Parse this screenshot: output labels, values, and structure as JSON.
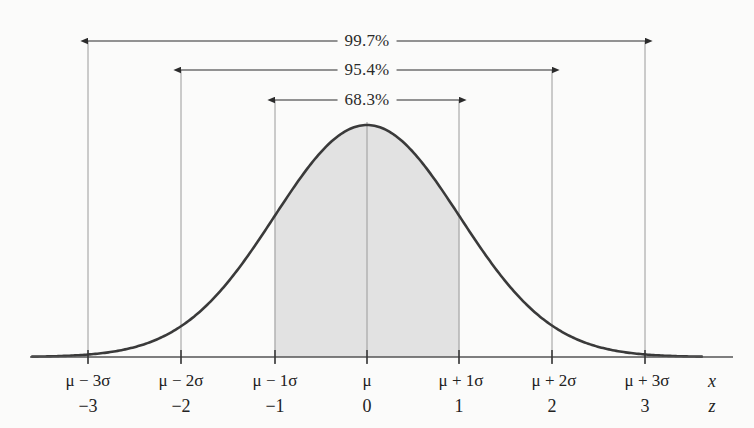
{
  "figure": {
    "type": "normal-distribution-empirical-rule",
    "background_color": "#fbfbfa",
    "curve_color": "#3a3a3a",
    "shade_color": "#e2e2e2",
    "guide_color": "#9a9a9a",
    "axis_color": "#555555"
  },
  "chart_data": {
    "type": "line",
    "title": "",
    "xlabel": "x",
    "ylabel": "",
    "grid": false,
    "legend": null,
    "distribution": "normal",
    "mean": 0,
    "sd": 1,
    "x": [
      -3.5,
      -3,
      -2,
      -1,
      0,
      1,
      2,
      3,
      3.5
    ],
    "y": [
      0.0009,
      0.0111,
      0.1353,
      0.6065,
      1.0,
      0.6065,
      0.1353,
      0.0111,
      0.0009
    ],
    "xlim": [
      -3.62,
      3.62
    ],
    "ylim": [
      0,
      1
    ],
    "shaded_region": {
      "from": -1,
      "to": 1,
      "label": "68.3%"
    },
    "annotations": [
      {
        "label": "99.7%",
        "from": -3,
        "to": 3,
        "row": 1
      },
      {
        "label": "95.4%",
        "from": -2,
        "to": 2,
        "row": 2
      },
      {
        "label": "68.3%",
        "from": -1,
        "to": 1,
        "row": 3
      }
    ],
    "tick_labels_x": [
      "μ − 3σ",
      "μ − 2σ",
      "μ − 1σ",
      "μ",
      "μ + 1σ",
      "μ + 2σ",
      "μ + 3σ"
    ],
    "tick_labels_z": [
      "−3",
      "−2",
      "−1",
      "0",
      "1",
      "2",
      "3"
    ],
    "categories": [
      "-3",
      "-2",
      "-1",
      "0",
      "1",
      "2",
      "3"
    ],
    "values": [
      0.0111,
      0.1353,
      0.6065,
      1.0,
      0.6065,
      0.1353,
      0.0111
    ]
  },
  "brackets": [
    {
      "text": "99.7%"
    },
    {
      "text": "95.4%"
    },
    {
      "text": "68.3%"
    }
  ],
  "axis_x": {
    "ticks": [
      {
        "mu": "μ − 3σ",
        "z": "−3"
      },
      {
        "mu": "μ − 2σ",
        "z": "−2"
      },
      {
        "mu": "μ − 1σ",
        "z": "−1"
      },
      {
        "mu": "μ",
        "z": "0"
      },
      {
        "mu": "μ + 1σ",
        "z": "1"
      },
      {
        "mu": "μ + 2σ",
        "z": "2"
      },
      {
        "mu": "μ + 3σ",
        "z": "3"
      }
    ],
    "axis_name_x": "x",
    "axis_name_z": "z"
  }
}
